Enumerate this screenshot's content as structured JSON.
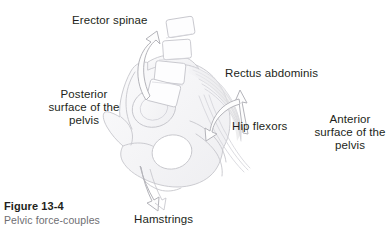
{
  "figure": {
    "caption_number": "Figure 13-4",
    "caption_text": "Pelvic force-couples",
    "caption_number_color": "#231f20",
    "caption_text_color": "#6e6e72"
  },
  "labels": {
    "erector_spinae": "Erector spinae",
    "rectus_abdominis": "Rectus abdominis",
    "posterior_surface": "Posterior surface of the pelvis",
    "hip_flexors": "Hip flexors",
    "anterior_surface": "Anterior surface of the pelvis",
    "hamstrings": "Hamstrings"
  },
  "illustration": {
    "subject": "pelvis-lateral-view-with-lumbar-vertebrae",
    "line_color": "#c9c9cf",
    "shade_color": "#e8e8ec",
    "arrow_outline_color": "#b8b8be",
    "vertebra_count": 4,
    "arrows": [
      {
        "name": "erector-spinae-arrow",
        "direction": "up",
        "muscle": "Erector spinae"
      },
      {
        "name": "rectus-abdominis-arrow",
        "direction": "up",
        "muscle": "Rectus abdominis"
      },
      {
        "name": "hip-flexors-arrow",
        "direction": "down-left",
        "muscle": "Hip flexors"
      },
      {
        "name": "hamstrings-arrow",
        "direction": "down",
        "muscle": "Hamstrings"
      }
    ]
  }
}
